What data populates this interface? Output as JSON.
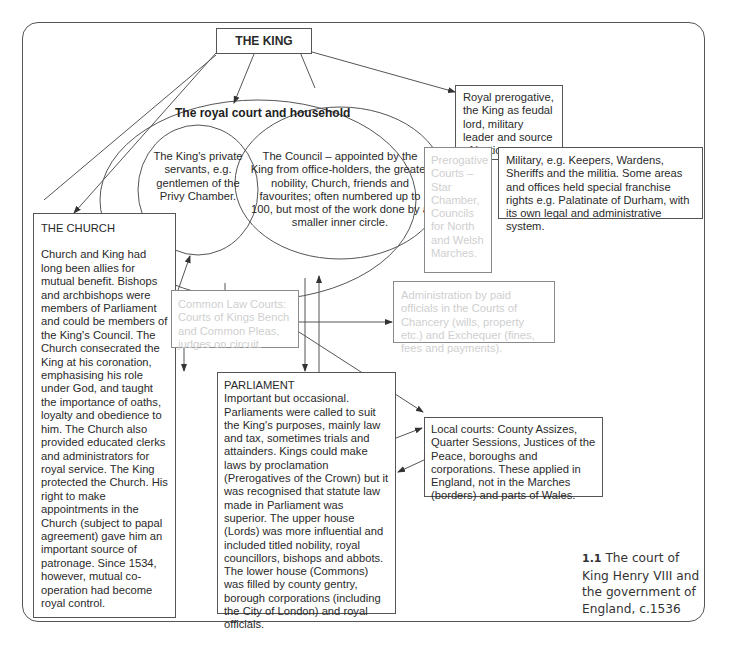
{
  "diagram": {
    "king": "THE KING",
    "court_title": "The royal court and household",
    "privy": "The King's private servants, e.g. gentlemen of the Privy Chamber.",
    "council": "The Council – appointed by the King from office-holders, the greater nobility, Church, friends and favourites; often numbered up to 100, but most of the work done by a smaller inner circle.",
    "prerogative": "Royal prerogative, the King as feudal lord, military leader and source of justice.",
    "prerogative_courts": "Prerogative Courts – Star Chamber, Councils for North and Welsh Marches.",
    "military": "Military, e.g. Keepers, Wardens, Sheriffs and the militia. Some areas and offices held special franchise rights e.g. Palatinate of Durham, with its own legal and administrative system.",
    "church_title": "THE CHURCH",
    "church_body": "Church and King had long been allies for mutual benefit. Bishops and archbishops were members of Parliament and could be members of the King's Council. The Church consecrated the King at his coronation, emphasising his role under God, and taught the importance of oaths, loyalty and obedience to him. The Church also provided educated clerks and administrators for royal service. The King protected the Church. His right to make appointments in the Church (subject to papal agreement) gave him an important source of patronage. Since 1534, however, mutual co-operation had become royal control.",
    "common_law": "Common Law Courts: Courts of Kings Bench and Common Pleas, judges on circuit.",
    "admin": "Administration by paid officials in the Courts of Chancery (wills, property etc.) and Exchequer (fines, fees and payments).",
    "parliament_title": "PARLIAMENT",
    "parliament_body": "Important but occasional. Parliaments were called to suit the King's purposes, mainly law and tax, sometimes trials and attainders. Kings could make laws by proclamation (Prerogatives of the Crown) but it was recognised that statute law made in Parliament was superior. The upper house (Lords) was more influential and included titled nobility, royal councillors, bishops and abbots. The lower house (Commons) was filled by county gentry, borough corporations (including the City of London) and royal officials.",
    "local": "Local courts: County Assizes, Quarter Sessions, Justices of the Peace, boroughs and corporations. These applied in England, not in the Marches (borders) and parts of Wales."
  },
  "caption": {
    "number": "1.1",
    "text": "The court of King Henry VIII and the government of England, c.1536"
  },
  "colors": {
    "line": "#555555",
    "text": "#2a2a2a",
    "faded_text": "#cfcfcf"
  }
}
